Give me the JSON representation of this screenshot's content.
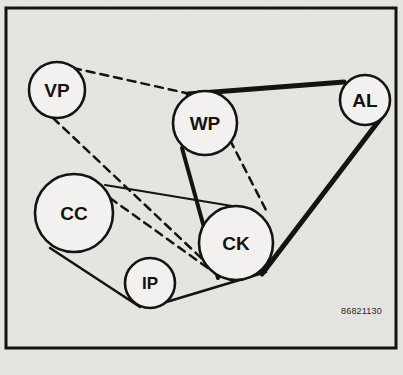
{
  "diagram": {
    "reference_code": "86821130",
    "background_color": "#f2f1ef",
    "ink_color": "#15130f",
    "frame": {
      "x": 6,
      "y": 8,
      "width": 390,
      "height": 340,
      "stroke_width": 3
    },
    "pulleys": [
      {
        "id": "VP",
        "label": "VP",
        "cx": 57,
        "cy": 90,
        "r": 28,
        "font_size": 19
      },
      {
        "id": "WP",
        "label": "WP",
        "cx": 205,
        "cy": 123,
        "r": 32,
        "font_size": 19
      },
      {
        "id": "AL",
        "label": "AL",
        "cx": 365,
        "cy": 100,
        "r": 25,
        "font_size": 19
      },
      {
        "id": "CC",
        "label": "CC",
        "cx": 74,
        "cy": 213,
        "r": 39,
        "font_size": 19
      },
      {
        "id": "CK",
        "label": "CK",
        "cx": 236,
        "cy": 243,
        "r": 37,
        "font_size": 19
      },
      {
        "id": "IP",
        "label": "IP",
        "cx": 150,
        "cy": 283,
        "r": 25,
        "font_size": 17
      }
    ],
    "belt_segments": [
      {
        "name": "wp-to-al-top",
        "style": "solid-thick",
        "from": "WP",
        "to": "AL",
        "stroke_width": 5,
        "path": "M 188 94 L 344 82"
      },
      {
        "name": "al-to-ck-right",
        "style": "solid-thick",
        "from": "AL",
        "to": "CK",
        "stroke_width": 5,
        "path": "M 384 114 L 262 274"
      },
      {
        "name": "wp-to-ck-left",
        "style": "solid-thick",
        "from": "WP",
        "to": "CK",
        "stroke_width": 4,
        "path": "M 182 148 L 218 278"
      },
      {
        "name": "cc-to-ck-top",
        "style": "solid-thin",
        "from": "CC",
        "to": "CK",
        "stroke_width": 2,
        "path": "M 105 185 L 232 206"
      },
      {
        "name": "cc-to-ip-bottom",
        "style": "solid-thin",
        "from": "CC",
        "to": "IP",
        "stroke_width": 2.5,
        "path": "M 50 248 L 140 307"
      },
      {
        "name": "ip-to-ck-bottom",
        "style": "solid-thin",
        "from": "IP",
        "to": "CK",
        "stroke_width": 2.5,
        "path": "M 163 303 L 266 272"
      }
    ],
    "dashed_segments": [
      {
        "name": "vp-to-wp-dashed",
        "from": "VP",
        "to": "WP",
        "stroke_width": 2.5,
        "dash": "8 6",
        "path": "M 73 68 L 186 93"
      },
      {
        "name": "vp-to-ck-dashed",
        "from": "VP",
        "to": "CK",
        "stroke_width": 2.5,
        "dash": "8 6",
        "path": "M 53 118 L 216 272"
      },
      {
        "name": "wp-to-ck-dashed",
        "from": "WP",
        "to": "CK",
        "stroke_width": 2.5,
        "dash": "8 6",
        "path": "M 230 140 L 268 214"
      },
      {
        "name": "cc-to-ck-dashed",
        "from": "CC",
        "to": "CK",
        "stroke_width": 2.5,
        "dash": "8 6",
        "path": "M 110 198 L 212 271"
      }
    ]
  }
}
